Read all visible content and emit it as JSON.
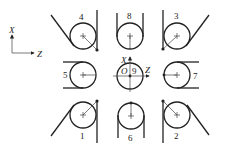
{
  "diagram": {
    "type": "tool-nose-orientation-positions",
    "axes_legend": {
      "vertical_label": "X",
      "horizontal_label": "Z"
    },
    "origin_label": "O",
    "center_axes": {
      "vertical_label": "X",
      "horizontal_label": "Z"
    },
    "positions": [
      {
        "id": "4",
        "label": "4",
        "row": "top",
        "col": "left"
      },
      {
        "id": "8",
        "label": "8",
        "row": "top",
        "col": "center"
      },
      {
        "id": "3",
        "label": "3",
        "row": "top",
        "col": "right"
      },
      {
        "id": "5",
        "label": "5",
        "row": "middle",
        "col": "left"
      },
      {
        "id": "9",
        "label": "9",
        "row": "middle",
        "col": "center"
      },
      {
        "id": "7",
        "label": "7",
        "row": "middle",
        "col": "right"
      },
      {
        "id": "1",
        "label": "1",
        "row": "bottom",
        "col": "left"
      },
      {
        "id": "6",
        "label": "6",
        "row": "bottom",
        "col": "center"
      },
      {
        "id": "2",
        "label": "2",
        "row": "bottom",
        "col": "right"
      }
    ],
    "colors": {
      "stroke": "#222222",
      "background": "#ffffff"
    }
  }
}
